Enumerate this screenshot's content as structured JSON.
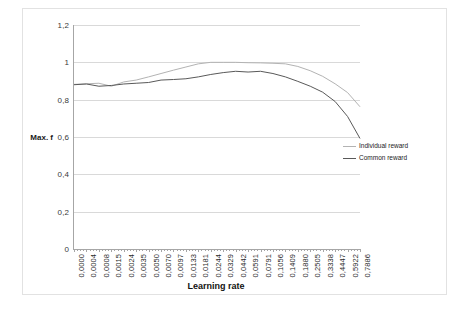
{
  "chart_data": {
    "type": "line",
    "title": "",
    "xlabel": "Learning rate",
    "ylabel": "Max. f",
    "ylim": [
      0,
      1.2
    ],
    "ytick_labels": [
      "0",
      "0,2",
      "0,4",
      "0,6",
      "0,8",
      "1",
      "1,2"
    ],
    "ytick_values": [
      0,
      0.2,
      0.4,
      0.6,
      0.8,
      1.0,
      1.2
    ],
    "grid": true,
    "legend_position": "right-middle",
    "categories": [
      "0,0000",
      "0,0004",
      "0,0008",
      "0,0015",
      "0,0024",
      "0,0035",
      "0,0050",
      "0,0070",
      "0,0097",
      "0,0133",
      "0,0181",
      "0,0244",
      "0,0329",
      "0,0442",
      "0,0591",
      "0,0791",
      "0,1056",
      "0,1409",
      "0,1880",
      "0,2505",
      "0,3338",
      "0,4447",
      "0,5922",
      "0,7886"
    ],
    "series": [
      {
        "name": "Individual reward",
        "color": "#b3b3b3",
        "values": [
          0.882,
          0.885,
          0.888,
          0.872,
          0.895,
          0.905,
          0.922,
          0.94,
          0.958,
          0.975,
          0.992,
          1.0,
          1.0,
          1.0,
          0.998,
          0.997,
          0.995,
          0.992,
          0.978,
          0.955,
          0.925,
          0.885,
          0.838,
          0.762
        ]
      },
      {
        "name": "Common reward",
        "color": "#595959",
        "values": [
          0.88,
          0.884,
          0.872,
          0.876,
          0.884,
          0.888,
          0.892,
          0.905,
          0.908,
          0.912,
          0.922,
          0.935,
          0.945,
          0.952,
          0.948,
          0.952,
          0.94,
          0.922,
          0.898,
          0.872,
          0.84,
          0.79,
          0.71,
          0.592
        ]
      }
    ],
    "minor_ticks_per_interval": 3
  },
  "legend": {
    "entries": [
      {
        "label": "Individual reward",
        "color": "#b3b3b3"
      },
      {
        "label": "Common reward",
        "color": "#595959"
      }
    ]
  }
}
